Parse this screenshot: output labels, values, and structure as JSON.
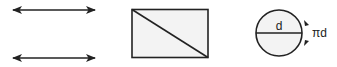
{
  "diagram": {
    "colors": {
      "stroke": "#222222",
      "fill": "#f3f3f3",
      "background": "#ffffff"
    },
    "figures": [
      {
        "id": "line-pair",
        "type": "double-headed-arrows",
        "count": 2
      },
      {
        "id": "rectangle",
        "type": "rectangle-with-diagonal"
      },
      {
        "id": "circle",
        "type": "circle-with-diameter"
      }
    ],
    "circle": {
      "diameter_label": "d",
      "circumference_label": "πd"
    }
  }
}
